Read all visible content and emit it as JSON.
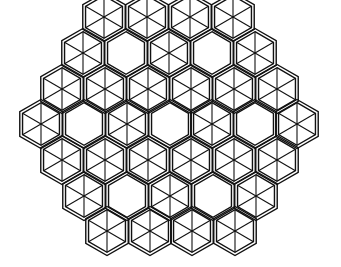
{
  "diagram": {
    "type": "hexagonal-tiling",
    "width": 341,
    "height": 267,
    "background": "#ffffff",
    "stroke_color": "#111111",
    "hex_radius": 24.5,
    "outline_style": "double",
    "rows": [
      {
        "y": 17,
        "cells": [
          {
            "x": 104,
            "spokes": true
          },
          {
            "x": 147,
            "spokes": true
          },
          {
            "x": 190,
            "spokes": true
          },
          {
            "x": 233,
            "spokes": true
          }
        ]
      },
      {
        "y": 53,
        "cells": [
          {
            "x": 83,
            "spokes": true
          },
          {
            "x": 126,
            "spokes": false
          },
          {
            "x": 169,
            "spokes": true
          },
          {
            "x": 212,
            "spokes": false
          },
          {
            "x": 255,
            "spokes": true
          }
        ]
      },
      {
        "y": 89,
        "cells": [
          {
            "x": 62,
            "spokes": true
          },
          {
            "x": 105,
            "spokes": true
          },
          {
            "x": 148,
            "spokes": true
          },
          {
            "x": 191,
            "spokes": true
          },
          {
            "x": 234,
            "spokes": true
          },
          {
            "x": 277,
            "spokes": true
          }
        ]
      },
      {
        "y": 124,
        "cells": [
          {
            "x": 41,
            "spokes": true
          },
          {
            "x": 84,
            "spokes": false
          },
          {
            "x": 127,
            "spokes": true
          },
          {
            "x": 170,
            "spokes": false
          },
          {
            "x": 212,
            "spokes": true
          },
          {
            "x": 255,
            "spokes": false
          },
          {
            "x": 297,
            "spokes": true
          }
        ]
      },
      {
        "y": 160,
        "cells": [
          {
            "x": 62,
            "spokes": true
          },
          {
            "x": 105,
            "spokes": true
          },
          {
            "x": 148,
            "spokes": true
          },
          {
            "x": 191,
            "spokes": true
          },
          {
            "x": 234,
            "spokes": true
          },
          {
            "x": 277,
            "spokes": true
          }
        ]
      },
      {
        "y": 196,
        "cells": [
          {
            "x": 84,
            "spokes": true
          },
          {
            "x": 127,
            "spokes": false
          },
          {
            "x": 170,
            "spokes": true
          },
          {
            "x": 213,
            "spokes": false
          },
          {
            "x": 256,
            "spokes": true
          }
        ]
      },
      {
        "y": 231,
        "cells": [
          {
            "x": 107,
            "spokes": true
          },
          {
            "x": 150,
            "spokes": true
          },
          {
            "x": 192,
            "spokes": true
          },
          {
            "x": 235,
            "spokes": true
          }
        ]
      }
    ]
  }
}
